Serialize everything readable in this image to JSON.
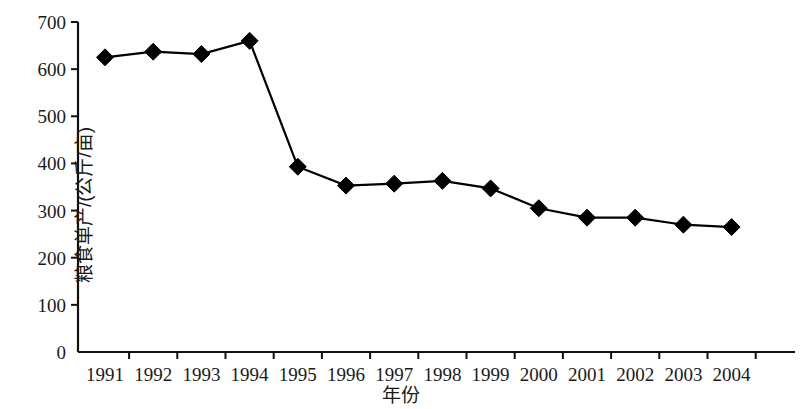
{
  "chart_data": {
    "type": "line",
    "title": "",
    "xlabel": "年份",
    "ylabel": "粮食单产/(公斤/亩)",
    "categories": [
      "1991",
      "1992",
      "1993",
      "1994",
      "1995",
      "1996",
      "1997",
      "1998",
      "1999",
      "2000",
      "2001",
      "2002",
      "2003",
      "2004"
    ],
    "values": [
      625,
      637,
      632,
      660,
      393,
      353,
      357,
      363,
      347,
      305,
      285,
      285,
      270,
      265
    ],
    "series": [
      {
        "name": "粮食单产",
        "values": [
          625,
          637,
          632,
          660,
          393,
          353,
          357,
          363,
          347,
          305,
          285,
          285,
          270,
          265
        ],
        "marker": "diamond",
        "color": "#000000"
      }
    ],
    "ylim": [
      0,
      700
    ],
    "yticks": [
      0,
      100,
      200,
      300,
      400,
      500,
      600,
      700
    ],
    "ytick_labels": [
      "0",
      "100",
      "200",
      "300",
      "400",
      "500",
      "600",
      "700"
    ],
    "xtick_labels": [
      "1991",
      "1992",
      "1993",
      "1994",
      "1995",
      "1996",
      "1997",
      "1998",
      "1999",
      "2000",
      "2001",
      "2002",
      "2003",
      "2004"
    ],
    "grid": false,
    "legend": false,
    "legend_position": "none",
    "line_color": "#000000",
    "marker_color": "#000000",
    "background_color": "#ffffff"
  }
}
